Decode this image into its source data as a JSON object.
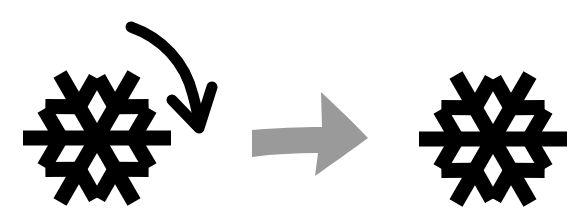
{
  "diagram": {
    "description": "Snowflake rotated clockwise results in an identical snowflake (rotational symmetry)",
    "elements": [
      {
        "id": "snowflake-before",
        "icon": "snowflake-icon",
        "color": "#000000",
        "center": [
          97,
          138
        ],
        "radius": 76
      },
      {
        "id": "rotation-arrow",
        "icon": "clockwise-curved-arrow-icon",
        "color": "#000000"
      },
      {
        "id": "transition-arrow",
        "icon": "right-arrow-icon",
        "color": "#9a9a9a"
      },
      {
        "id": "snowflake-after",
        "icon": "snowflake-icon",
        "color": "#000000",
        "center": [
          493,
          138
        ],
        "radius": 76
      }
    ]
  },
  "colors": {
    "background": "#ffffff",
    "snowflake": "#000000",
    "rotation_arrow": "#000000",
    "transition_arrow": "#9a9a9a"
  }
}
